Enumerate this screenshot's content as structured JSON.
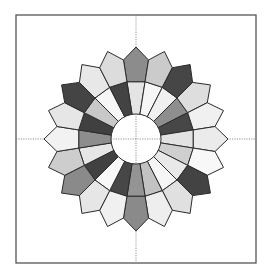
{
  "diagram": {
    "frame": {
      "x": 16,
      "y": 15,
      "width": 240,
      "height": 248
    },
    "center": {
      "x": 136,
      "y": 139
    },
    "hub_radius": 25,
    "inner_radius": 58,
    "shoulder_radius": 80,
    "tip_radius": 92,
    "petal_count": 20,
    "start_angle_deg": -90,
    "petals": [
      {
        "outer": "#8c8c8c",
        "inner": "#e4e4e4"
      },
      {
        "outer": "#cbcbcb",
        "inner": "#f6f6f6"
      },
      {
        "outer": "#464646",
        "inner": "#f0f0f0"
      },
      {
        "outer": "#dedede",
        "inner": "#8e8e8e"
      },
      {
        "outer": "#f0f0f0",
        "inner": "#474747"
      },
      {
        "outer": "#ebebeb",
        "inner": "#e2e2e2"
      },
      {
        "outer": "#f8f8f8",
        "inner": "#cfcfcf"
      },
      {
        "outer": "#434343",
        "inner": "#e9e9e9"
      },
      {
        "outer": "#e0e0e0",
        "inner": "#f6f6f6"
      },
      {
        "outer": "#eeeeee",
        "inner": "#c2c2c2"
      },
      {
        "outer": "#8a8a8a",
        "inner": "#949494"
      },
      {
        "outer": "#f0f0f0",
        "inner": "#474747"
      },
      {
        "outer": "#e6e6e6",
        "inner": "#f8f8f8"
      },
      {
        "outer": "#8a8a8a",
        "inner": "#414141"
      },
      {
        "outer": "#cdcdcd",
        "inner": "#e6e6e6"
      },
      {
        "outer": "#f2f2f2",
        "inner": "#8d8d8d"
      },
      {
        "outer": "#e6e6e6",
        "inner": "#404040"
      },
      {
        "outer": "#444444",
        "inner": "#c8c8c8"
      },
      {
        "outer": "#e8e8e8",
        "inner": "#f6f6f6"
      },
      {
        "outer": "#dcdcdc",
        "inner": "#434343"
      }
    ]
  }
}
